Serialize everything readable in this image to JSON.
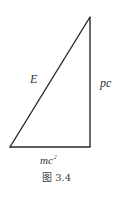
{
  "figure": {
    "caption": "图 3.4",
    "line_color": "#2a2a2a",
    "triangle": {
      "vertices": {
        "bottom_left": [
          10,
          147
        ],
        "bottom_right": [
          90,
          147
        ],
        "top": [
          90,
          17
        ]
      }
    },
    "labels": {
      "hypotenuse": "E",
      "vertical_leg": "pc",
      "horizontal_leg_base": "mc",
      "horizontal_leg_exponent": "2"
    }
  }
}
